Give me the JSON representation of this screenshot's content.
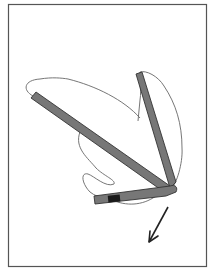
{
  "figure": {
    "frame": {
      "x": 8,
      "y": 4,
      "width": 198,
      "height": 262,
      "stroke": "#555555"
    },
    "colors": {
      "member_fill": "#777777",
      "member_stroke": "#333333",
      "outline": "#666666",
      "band": "#1a1a1a",
      "arrow": "#222222"
    },
    "arrow": {
      "direction": "down-left"
    }
  }
}
